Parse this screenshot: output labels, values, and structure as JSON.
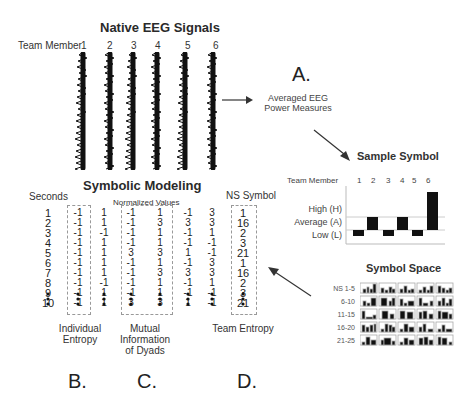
{
  "eeg": {
    "title": "Native EEG Signals",
    "member_label": "Team Member",
    "members": [
      "1",
      "2",
      "3",
      "4",
      "5",
      "6"
    ]
  },
  "panel_a": {
    "letter": "A.",
    "avg_line1": "Averaged EEG",
    "avg_line2": "Power Measures"
  },
  "sample_symbol": {
    "title": "Sample Symbol",
    "member_label": "Team Member",
    "members": [
      "1",
      "2",
      "3",
      "4",
      "5",
      "6"
    ],
    "levels": [
      "High (H)",
      "Average (A)",
      "Low (L)"
    ],
    "bar_levels": [
      "L",
      "A",
      "L",
      "A",
      "L",
      "H"
    ]
  },
  "symbol_space": {
    "title": "Symbol Space",
    "rows": [
      "NS 1-5",
      "6-10",
      "11-15",
      "16-20",
      "21-25"
    ]
  },
  "symbolic_modeling": {
    "title": "Symbolic Modeling",
    "seconds_label": "Seconds",
    "normalized_label": "Normalized Values",
    "ns_symbol_label": "NS Symbol",
    "seconds": [
      "1",
      "2",
      "3",
      "4",
      "5",
      "6",
      "7",
      "8",
      "9",
      "10"
    ],
    "individual": [
      "-1",
      "-1",
      "-1",
      "-1",
      "-1",
      "-1",
      "-1",
      "-1",
      "-1",
      "-1"
    ],
    "col2": [
      "1",
      "1",
      "-1",
      "1",
      "1",
      "1",
      "1",
      "-1",
      "1",
      "1"
    ],
    "mutual_a": [
      "-1",
      "-1",
      "-1",
      "-1",
      "3",
      "-1",
      "-1",
      "-1",
      "-1",
      "3"
    ],
    "mutual_b": [
      "1",
      "3",
      "1",
      "1",
      "3",
      "1",
      "3",
      "1",
      "1",
      "3"
    ],
    "col5": [
      "-1",
      "3",
      "-1",
      "-1",
      "1",
      "-1",
      "3",
      "-1",
      "-1",
      "1"
    ],
    "col6": [
      "3",
      "3",
      "1",
      "-1",
      "-1",
      "3",
      "3",
      "1",
      "-1",
      "-1"
    ],
    "ns_symbol": [
      "1",
      "16",
      "2",
      "3",
      "21",
      "1",
      "16",
      "2",
      "3",
      "21"
    ]
  },
  "captions": {
    "b_line1": "Individual",
    "b_line2": "Entropy",
    "c_line1": "Mutual",
    "c_line2": "Information",
    "c_line3": "of Dyads",
    "d_line1": "Team Entropy",
    "b_letter": "B.",
    "c_letter": "C.",
    "d_letter": "D."
  }
}
